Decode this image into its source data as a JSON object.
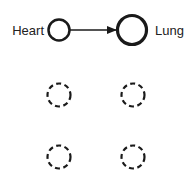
{
  "nodes": [
    {
      "id": "heart",
      "label": "Heart",
      "state": "active",
      "cx": 59,
      "cy": 30,
      "r": 10.5,
      "stroke_width": 2.5
    },
    {
      "id": "lung",
      "label": "Lung",
      "state": "active",
      "cx": 132,
      "cy": 30,
      "r": 14.5,
      "stroke_width": 3.2
    },
    {
      "id": "empty-1",
      "label": "",
      "state": "placeholder",
      "cx": 59,
      "cy": 95,
      "r": 11.5
    },
    {
      "id": "empty-2",
      "label": "",
      "state": "placeholder",
      "cx": 133,
      "cy": 95,
      "r": 11.5
    },
    {
      "id": "empty-3",
      "label": "",
      "state": "placeholder",
      "cx": 59,
      "cy": 157,
      "r": 11.5
    },
    {
      "id": "empty-4",
      "label": "",
      "state": "placeholder",
      "cx": 133,
      "cy": 157,
      "r": 11.5
    }
  ],
  "edges": [
    {
      "from": "heart",
      "to": "lung",
      "directed": true
    }
  ],
  "colors": {
    "stroke": "#1a1a1a",
    "text": "#222222",
    "background": "#ffffff"
  }
}
